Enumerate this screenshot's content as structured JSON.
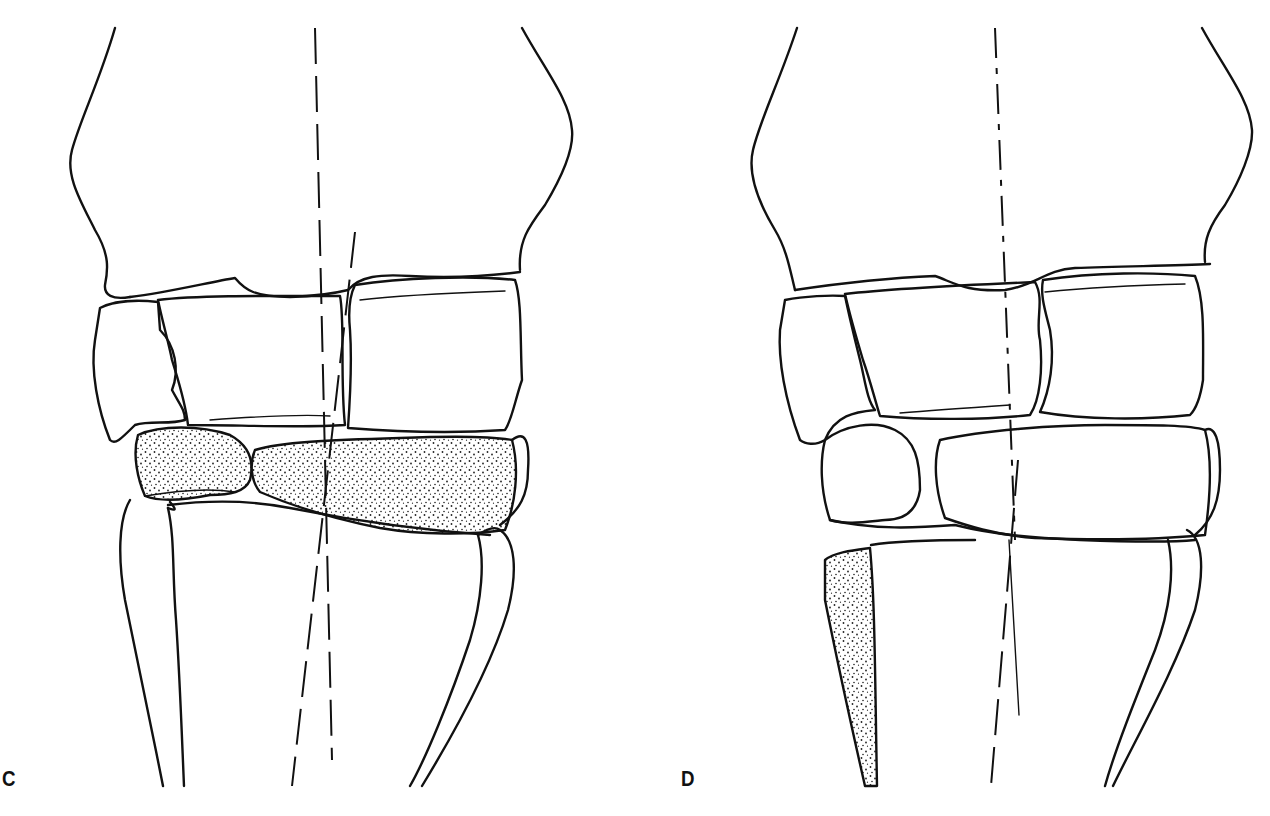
{
  "figure": {
    "panels": [
      {
        "label": "C",
        "description": "Carpal row with stippled (highlighted) distal carpal bones; two dashed axis lines diverge through the joint",
        "shaded_regions": [
          "distal-carpal-bone-medial",
          "distal-carpal-bone-lateral"
        ],
        "axis_lines": 2
      },
      {
        "label": "D",
        "description": "Carpal row in normal alignment; stippled small splint bone on the lower left; dash-dot axis lines nearly aligned",
        "shaded_regions": [
          "splint-bone-medial"
        ],
        "axis_lines": 2
      }
    ],
    "colors": {
      "line": "#111111",
      "background": "#ffffff",
      "stipple": "#222222"
    }
  }
}
